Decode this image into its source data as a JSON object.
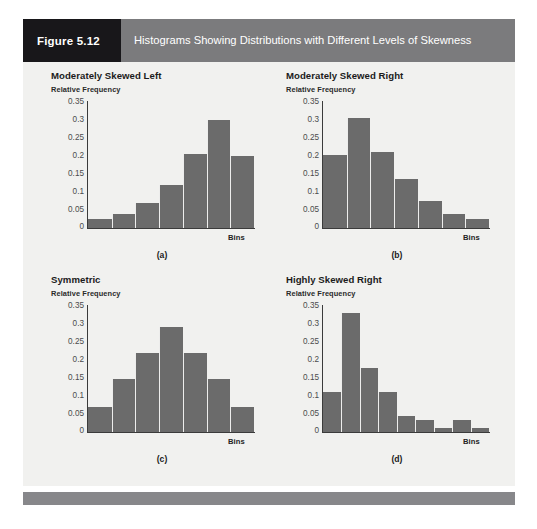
{
  "figure": {
    "number_label": "Figure 5.12",
    "title": "Histograms Showing Distributions with Different Levels of Skewness",
    "header_dark_color": "#18171a",
    "header_gray_color": "#7b7b7d",
    "body_background": "#f1f1ef",
    "footer_color": "#87878a",
    "bar_color": "#6b6b6b",
    "axis_color": "#3b3b3b"
  },
  "axis": {
    "ylabel": "Relative Frequency",
    "xlabel": "Bins",
    "yticks": [
      "0.35",
      "0.3",
      "0.25",
      "0.2",
      "0.15",
      "0.1",
      "0.05",
      "0"
    ],
    "ymin": 0,
    "ymax": 0.35
  },
  "panels": [
    {
      "title": "Moderately Skewed Left",
      "caption": "(a)"
    },
    {
      "title": "Moderately Skewed Right",
      "caption": "(b)"
    },
    {
      "title": "Symmetric",
      "caption": "(c)"
    },
    {
      "title": "Highly Skewed Right",
      "caption": "(d)"
    }
  ],
  "chart_data": [
    {
      "type": "bar",
      "title": "Moderately Skewed Left",
      "caption": "(a)",
      "xlabel": "Bins",
      "ylabel": "Relative Frequency",
      "ylim": [
        0,
        0.35
      ],
      "yticks": [
        0,
        0.05,
        0.1,
        0.15,
        0.2,
        0.25,
        0.3,
        0.35
      ],
      "grid": false,
      "legend": "none",
      "categories": [
        "1",
        "2",
        "3",
        "4",
        "5",
        "6",
        "7"
      ],
      "values": [
        0.025,
        0.04,
        0.07,
        0.12,
        0.205,
        0.3,
        0.2
      ]
    },
    {
      "type": "bar",
      "title": "Moderately Skewed Right",
      "caption": "(b)",
      "xlabel": "Bins",
      "ylabel": "Relative Frequency",
      "ylim": [
        0,
        0.35
      ],
      "yticks": [
        0,
        0.05,
        0.1,
        0.15,
        0.2,
        0.25,
        0.3,
        0.35
      ],
      "grid": false,
      "legend": "none",
      "categories": [
        "1",
        "2",
        "3",
        "4",
        "5",
        "6",
        "7"
      ],
      "values": [
        0.203,
        0.305,
        0.21,
        0.135,
        0.075,
        0.038,
        0.025
      ]
    },
    {
      "type": "bar",
      "title": "Symmetric",
      "caption": "(c)",
      "xlabel": "Bins",
      "ylabel": "Relative Frequency",
      "ylim": [
        0,
        0.35
      ],
      "yticks": [
        0,
        0.05,
        0.1,
        0.15,
        0.2,
        0.25,
        0.3,
        0.35
      ],
      "grid": false,
      "legend": "none",
      "categories": [
        "1",
        "2",
        "3",
        "4",
        "5",
        "6",
        "7"
      ],
      "values": [
        0.07,
        0.148,
        0.22,
        0.293,
        0.22,
        0.148,
        0.07
      ]
    },
    {
      "type": "bar",
      "title": "Highly Skewed Right",
      "caption": "(d)",
      "xlabel": "Bins",
      "ylabel": "Relative Frequency",
      "ylim": [
        0,
        0.35
      ],
      "yticks": [
        0,
        0.05,
        0.1,
        0.15,
        0.2,
        0.25,
        0.3,
        0.35
      ],
      "grid": false,
      "legend": "none",
      "categories": [
        "1",
        "2",
        "3",
        "4",
        "5",
        "6",
        "7",
        "8",
        "9"
      ],
      "values": [
        0.11,
        0.33,
        0.178,
        0.112,
        0.045,
        0.033,
        0.011,
        0.032,
        0.012
      ]
    }
  ]
}
